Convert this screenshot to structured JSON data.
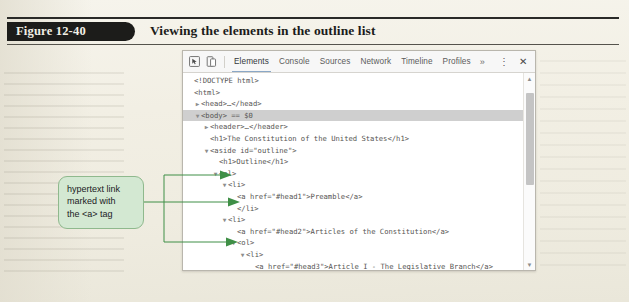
{
  "figure": {
    "number_label": "Figure 12-40",
    "title": "Viewing the elements in the outline list"
  },
  "devtools": {
    "toolbar": {
      "inspect_icon": "inspect-element-icon",
      "device_icon": "device-toolbar-icon",
      "tabs": [
        {
          "label": "Elements",
          "active": true
        },
        {
          "label": "Console",
          "active": false
        },
        {
          "label": "Sources",
          "active": false
        },
        {
          "label": "Network",
          "active": false
        },
        {
          "label": "Timeline",
          "active": false
        },
        {
          "label": "Profiles",
          "active": false
        }
      ],
      "more_tabs_label": "»",
      "menu_label": "⋮",
      "close_label": "✕",
      "active_tab_underline_color": "#8aa7c6"
    },
    "dom_tree": [
      {
        "indent": 0,
        "twisty": "",
        "text": "<!DOCTYPE html>",
        "selected": false
      },
      {
        "indent": 0,
        "twisty": "",
        "text": "<html>",
        "selected": false
      },
      {
        "indent": 1,
        "twisty": "▶",
        "text": "<head>…</head>",
        "selected": false
      },
      {
        "indent": 1,
        "twisty": "▼",
        "text": "<body> == $0",
        "selected": true
      },
      {
        "indent": 2,
        "twisty": "▶",
        "text": "<header>…</header>",
        "selected": false
      },
      {
        "indent": 2,
        "twisty": "",
        "text": "<h1>The Constitution of the United States</h1>",
        "selected": false
      },
      {
        "indent": 2,
        "twisty": "▼",
        "text": "<aside id=\"outline\">",
        "selected": false
      },
      {
        "indent": 3,
        "twisty": "",
        "text": "<h1>Outline</h1>",
        "selected": false
      },
      {
        "indent": 3,
        "twisty": "▼",
        "text": "<ol>",
        "selected": false
      },
      {
        "indent": 4,
        "twisty": "▼",
        "text": "<li>",
        "selected": false
      },
      {
        "indent": 5,
        "twisty": "",
        "text": "<a href=\"#head1\">Preamble</a>",
        "selected": false
      },
      {
        "indent": 5,
        "twisty": "",
        "text": "</li>",
        "selected": false
      },
      {
        "indent": 4,
        "twisty": "▼",
        "text": "<li>",
        "selected": false
      },
      {
        "indent": 5,
        "twisty": "",
        "text": "<a href=\"#head2\">Articles of the Constitution</a>",
        "selected": false
      },
      {
        "indent": 5,
        "twisty": "▼",
        "text": "<ol>",
        "selected": false
      },
      {
        "indent": 6,
        "twisty": "▼",
        "text": "<li>",
        "selected": false
      },
      {
        "indent": 7,
        "twisty": "",
        "text": "<a href=\"#head3\">Article I - The Legislative Branch</a>",
        "selected": false
      },
      {
        "indent": 7,
        "twisty": "▶",
        "text": "<ol>…</ol>",
        "selected": false
      },
      {
        "indent": 7,
        "twisty": "",
        "text": "</li>",
        "selected": false
      },
      {
        "indent": 6,
        "twisty": "▶",
        "text": "<li>…</li>",
        "selected": false
      },
      {
        "indent": 6,
        "twisty": "▶",
        "text": "<li>…</li>",
        "selected": false
      }
    ],
    "scrollbar": {
      "up_arrow": "▲",
      "down_arrow": "▼"
    }
  },
  "callout": {
    "line1": "hypertext link",
    "line2": "marked with",
    "line3": "the <a> tag",
    "fill_color": "#d3e8d2",
    "border_color": "#8fb98d",
    "leader_color": "#3f8f46"
  }
}
